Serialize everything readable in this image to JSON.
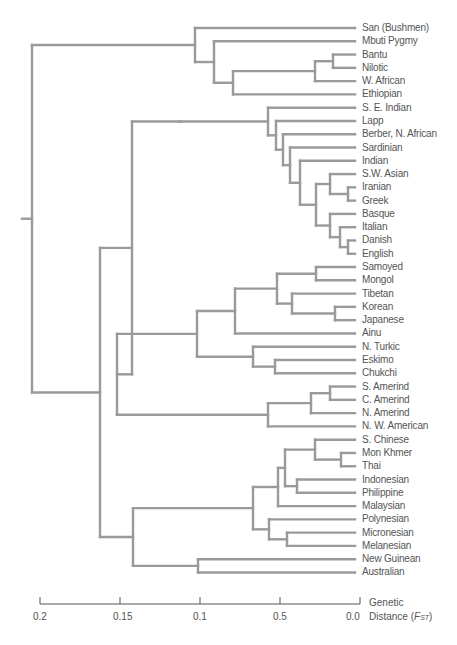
{
  "header": {
    "fragment": "Genetic..."
  },
  "chart_data": {
    "type": "dendrogram",
    "title": "",
    "xlabel": "Genetic Distance (FST)",
    "axis": {
      "ticks": [
        {
          "label": "0.2",
          "x": 40
        },
        {
          "label": "0.15",
          "x": 120
        },
        {
          "label": "0.1",
          "x": 200
        },
        {
          "label": "0.5",
          "x": 280
        },
        {
          "label": "0.0",
          "x": 360
        }
      ],
      "title_line1": "Genetic",
      "title_line2": "Distance (",
      "title_symbol": "F",
      "title_subscript": "ST",
      "title_close": ")"
    },
    "leaves": [
      "San (Bushmen)",
      "Mbuti Pygmy",
      "Bantu",
      "Nilotic",
      "W. African",
      "Ethiopian",
      "S. E. Indian",
      "Lapp",
      "Berber, N. African",
      "Sardinian",
      "Indian",
      "S.W. Asian",
      "Iranian",
      "Greek",
      "Basque",
      "Italian",
      "Danish",
      "English",
      "Samoyed",
      "Mongol",
      "Tibetan",
      "Korean",
      "Japanese",
      "Ainu",
      "N. Turkic",
      "Eskimo",
      "Chukchi",
      "S. Amerind",
      "C. Amerind",
      "N. Amerind",
      "N. W. American",
      "S. Chinese",
      "Mon Khmer",
      "Thai",
      "Indonesian",
      "Philippine",
      "Malaysian",
      "Polynesian",
      "Micronesian",
      "Melanesian",
      "New Guinean",
      "Australian"
    ],
    "line_color": "#9a9a9a",
    "axis_color": "#555555"
  }
}
